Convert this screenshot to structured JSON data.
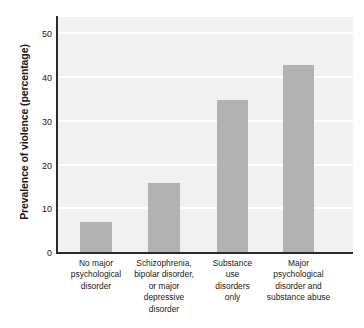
{
  "chart_data": {
    "type": "bar",
    "title": "",
    "xlabel": "",
    "ylabel": "Prevalence of violence (percentage)",
    "categories": [
      "No major psychological disorder",
      "Schizophrenia, bipolar disorder, or major depressive disorder",
      "Substance use disorders only",
      "Major psychological disorder and substance abuse"
    ],
    "category_lines": [
      [
        "No major",
        "psychological",
        "disorder"
      ],
      [
        "Schizophrenia,",
        "bipolar disorder,",
        "or major",
        "depressive",
        "disorder"
      ],
      [
        "Substance",
        "use",
        "disorders",
        "only"
      ],
      [
        "Major",
        "psychological",
        "disorder and",
        "substance abuse"
      ]
    ],
    "values": [
      7,
      16,
      35,
      43
    ],
    "ylim": [
      0,
      54
    ],
    "yticks": [
      0,
      10,
      20,
      30,
      40,
      50
    ],
    "ytick_labels": [
      "0",
      "10",
      "20",
      "30",
      "40",
      "50"
    ],
    "grid": "horizontal-white",
    "legend": "none",
    "bar_color": "#b2b2b2",
    "plot_background": "#f1f1f1",
    "gridline_color": "#ffffff",
    "axis_color": "#2b2b2b",
    "text_color": "#1a1a1a"
  }
}
